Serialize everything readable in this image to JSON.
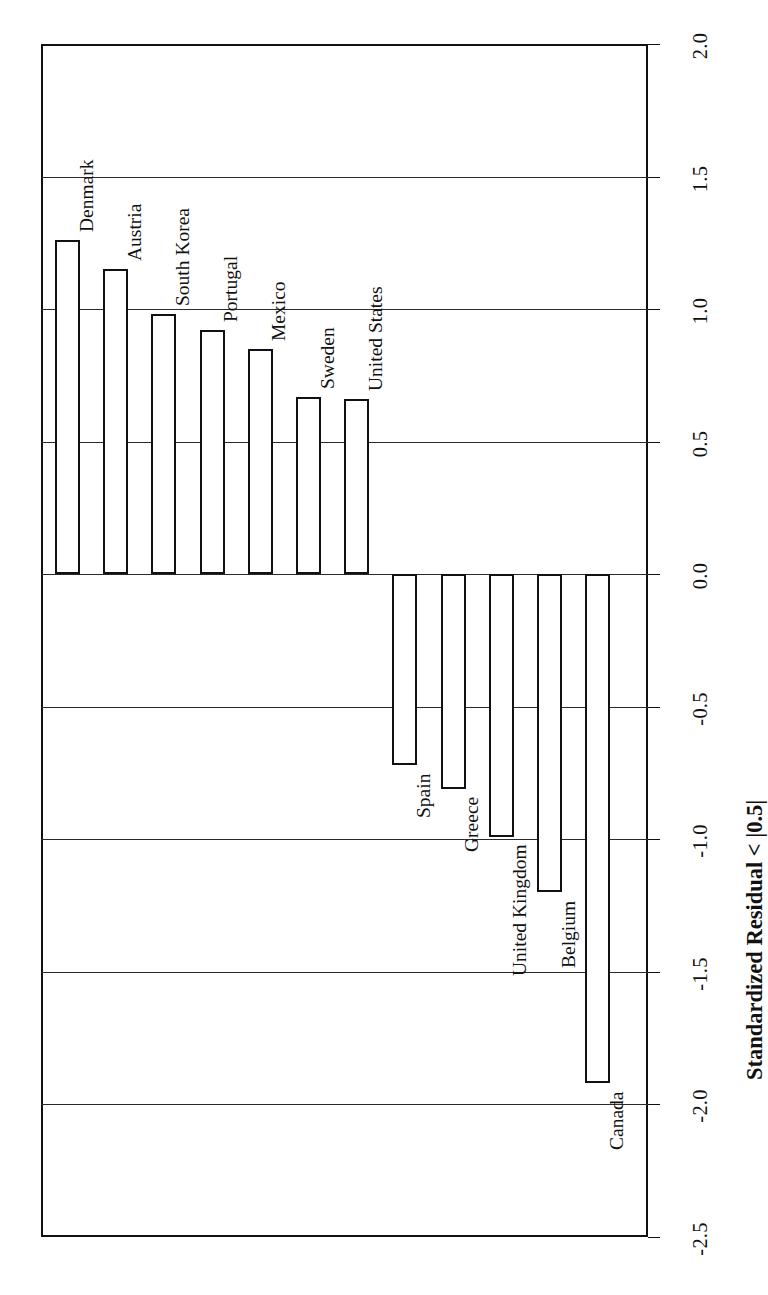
{
  "figure": {
    "axis_title": "Standardized Residual < |0.5|",
    "background_color": "#ffffff",
    "line_color": "#111111",
    "bar_fill": "#ffffff",
    "grid_color": "#2b2b2b"
  },
  "axis": {
    "tick_labels": [
      "2.0",
      "1.5",
      "1.0",
      "0.5",
      "0.0",
      "-0.5",
      "-1.0",
      "-1.5",
      "-2.0",
      "-2.5"
    ],
    "tick_values": [
      2.0,
      1.5,
      1.0,
      0.5,
      0.0,
      -0.5,
      -1.0,
      -1.5,
      -2.0,
      -2.5
    ],
    "min": -2.5,
    "max": 2.0
  },
  "chart_data": {
    "type": "bar",
    "title": "",
    "xlabel": "",
    "ylabel": "Standardized Residual < |0.5|",
    "orientation": "vertical-bars-rotated",
    "grid": true,
    "legend": "none",
    "ylim": [
      -2.5,
      2.0
    ],
    "categories": [
      "Denmark",
      "Austria",
      "South Korea",
      "Portugal",
      "Mexico",
      "Sweden",
      "United States",
      "Spain",
      "Greece",
      "United Kingdom",
      "Belgium",
      "Canada"
    ],
    "values": [
      1.26,
      1.15,
      0.98,
      0.92,
      0.85,
      0.67,
      0.66,
      -0.72,
      -0.81,
      -0.99,
      -1.2,
      -1.92
    ]
  }
}
